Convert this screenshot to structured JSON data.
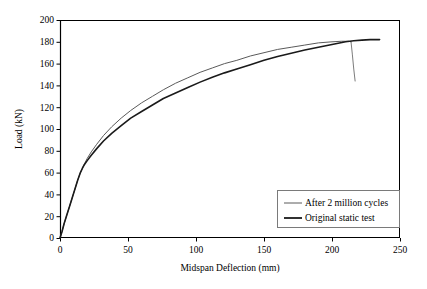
{
  "chart_data": {
    "type": "line",
    "title": "",
    "xlabel": "Midspan Deflection (mm)",
    "ylabel": "Load (kN)",
    "xlim": [
      0,
      250
    ],
    "ylim": [
      0,
      200
    ],
    "xticks": [
      0,
      50,
      100,
      150,
      200,
      250
    ],
    "yticks": [
      0,
      20,
      40,
      60,
      80,
      100,
      120,
      140,
      160,
      180,
      200
    ],
    "grid": false,
    "legend_position": "lower right",
    "series": [
      {
        "name": "After 2 million cycles",
        "color": "#5a5a5a",
        "linewidth": 1.0,
        "x": [
          0,
          1.5,
          3,
          5,
          7,
          9,
          11,
          13,
          15,
          16.5,
          18,
          20,
          23,
          27,
          32,
          38,
          45,
          52,
          60,
          68,
          76,
          85,
          94,
          103,
          112,
          121,
          130,
          140,
          150,
          160,
          170,
          180,
          190,
          200,
          207,
          212,
          214
        ],
        "y": [
          0,
          6,
          13,
          21,
          29,
          37,
          45,
          53,
          60,
          64,
          68,
          73,
          79,
          86,
          94,
          102,
          110,
          117,
          124,
          130,
          136,
          142,
          147,
          152,
          156,
          160,
          163,
          167,
          170,
          173,
          175,
          177,
          179,
          180,
          180.5,
          180.5,
          180
        ]
      },
      {
        "name": "After 2 million cycles (post-peak drop)",
        "color": "#5a5a5a",
        "linewidth": 0.8,
        "x": [
          214,
          215,
          216,
          217
        ],
        "y": [
          180,
          168,
          155,
          144
        ]
      },
      {
        "name": "Original static test",
        "color": "#1a1a1a",
        "linewidth": 1.6,
        "x": [
          0,
          1.5,
          3,
          5,
          7,
          9,
          11,
          13,
          15,
          16.5,
          18,
          20,
          23,
          27,
          32,
          38,
          45,
          52,
          60,
          68,
          76,
          85,
          94,
          103,
          112,
          121,
          130,
          140,
          150,
          160,
          170,
          180,
          190,
          200,
          210,
          216,
          222,
          228,
          232,
          235
        ],
        "y": [
          0,
          6,
          13,
          21,
          29,
          37,
          45,
          53,
          60,
          64,
          67.5,
          71,
          76,
          82,
          89,
          96,
          103,
          110,
          116,
          122,
          128,
          133,
          138,
          143,
          147.5,
          151.5,
          155,
          159,
          163,
          166.5,
          169.5,
          172.5,
          175,
          177.5,
          180,
          181,
          181.5,
          182,
          182,
          182
        ]
      }
    ],
    "annotations": []
  },
  "legend": {
    "items": [
      {
        "label": "After 2 million cycles",
        "color": "#5a5a5a",
        "linewidth": 1.0
      },
      {
        "label": "Original static test",
        "color": "#1a1a1a",
        "linewidth": 1.8
      }
    ]
  },
  "axes": {
    "x_title": "Midspan Deflection (mm)",
    "y_title": "Load (kN)",
    "x_tick_labels": [
      "0",
      "50",
      "100",
      "150",
      "200",
      "250"
    ],
    "y_tick_labels": [
      "0",
      "20",
      "40",
      "60",
      "80",
      "100",
      "120",
      "140",
      "160",
      "180",
      "200"
    ]
  }
}
